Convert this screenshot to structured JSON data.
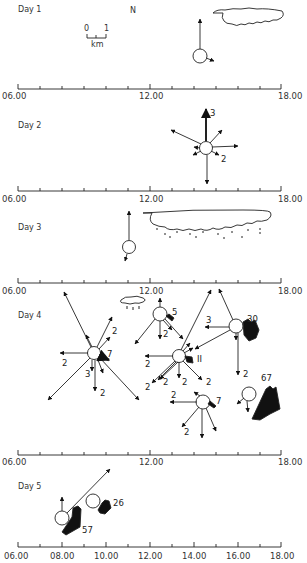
{
  "figure": {
    "north_label": "N",
    "scale": {
      "zero": "0",
      "one": "1",
      "unit": "km"
    },
    "days": [
      {
        "label": "Day 1",
        "axis_ticks": [
          "06.00",
          "12.00",
          "18.00"
        ]
      },
      {
        "label": "Day 2",
        "axis_ticks": [
          "06.00",
          "12.00",
          "18.00"
        ]
      },
      {
        "label": "Day 3",
        "axis_ticks": [
          "06.00",
          "12.00",
          "18.00"
        ]
      },
      {
        "label": "Day 4",
        "axis_ticks": [
          "06.00",
          "12.00",
          "18.00"
        ]
      },
      {
        "label": "Day 5",
        "axis_ticks": [
          "06.00",
          "08.00",
          "10.00",
          "12.00",
          "14.00",
          "16.00",
          "18.00"
        ]
      }
    ],
    "annotations": {
      "day2": {
        "north": "3",
        "se": "2"
      },
      "day4": {
        "a": {
          "e": "7",
          "ne": "2",
          "w": "2",
          "s": "2",
          "sw": "3"
        },
        "b": {
          "label": "5",
          "s": "2"
        },
        "c": {
          "label": "II",
          "w": "2",
          "sw1": "2",
          "sw2": "2",
          "s": "2",
          "se": "2"
        },
        "d": {
          "label": "30",
          "w": "3",
          "s": "2"
        },
        "e": {
          "label": "7",
          "w": "2",
          "sw": "2"
        },
        "f": {
          "label": "67"
        }
      },
      "day5": {
        "a": "57",
        "b": "26"
      }
    }
  }
}
